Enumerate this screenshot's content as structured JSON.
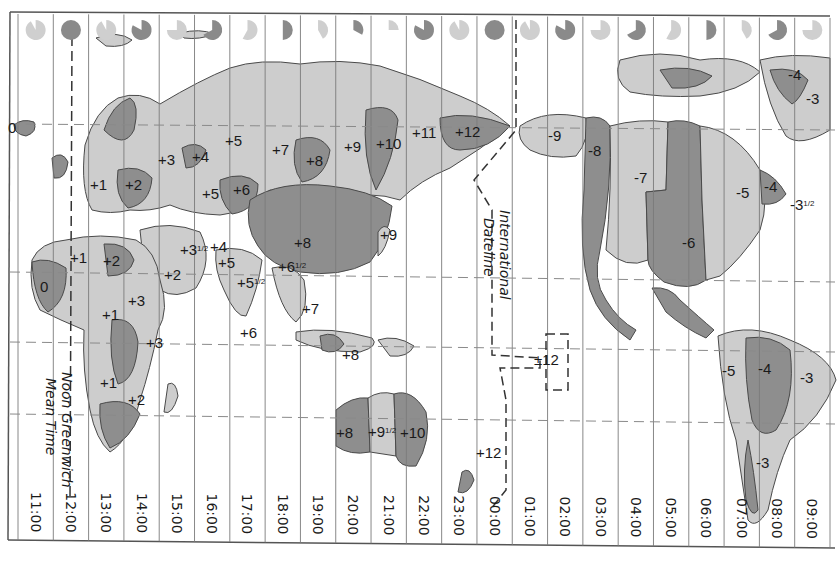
{
  "map": {
    "title": "World Time Zones",
    "colors": {
      "paper": "#ffffff",
      "land_light": "#cdcdcd",
      "land_dark": "#8e8e8e",
      "border": "#4a4a4a",
      "grid": "#7a7a7a",
      "text": "#1a1a1a",
      "clock_light": "#cfcfcf",
      "clock_dark": "#8a8a8a"
    },
    "columns": {
      "count": 23,
      "times": [
        "11:00",
        "12:00",
        "13:00",
        "14:00",
        "15:00",
        "16:00",
        "17:00",
        "18:00",
        "19:00",
        "20:00",
        "21:00",
        "22:00",
        "23:00",
        "00:00",
        "01:00",
        "02:00",
        "03:00",
        "04:00",
        "05:00",
        "06:00",
        "07:00",
        "08:00",
        "09:00"
      ]
    },
    "clock_faces": [
      {
        "tone": "light",
        "fill_fraction": 0.92
      },
      {
        "tone": "dark",
        "fill_fraction": 1.0
      },
      {
        "tone": "light",
        "fill_fraction": 0.92
      },
      {
        "tone": "dark",
        "fill_fraction": 0.83
      },
      {
        "tone": "light",
        "fill_fraction": 0.75
      },
      {
        "tone": "dark",
        "fill_fraction": 0.67
      },
      {
        "tone": "light",
        "fill_fraction": 0.58
      },
      {
        "tone": "dark",
        "fill_fraction": 0.5
      },
      {
        "tone": "light",
        "fill_fraction": 0.42
      },
      {
        "tone": "dark",
        "fill_fraction": 0.33
      },
      {
        "tone": "light",
        "fill_fraction": 0.25
      },
      {
        "tone": "dark",
        "fill_fraction": 0.83
      },
      {
        "tone": "light",
        "fill_fraction": 0.92
      },
      {
        "tone": "dark",
        "fill_fraction": 1.0
      },
      {
        "tone": "light",
        "fill_fraction": 0.92
      },
      {
        "tone": "dark",
        "fill_fraction": 0.83
      },
      {
        "tone": "light",
        "fill_fraction": 0.75
      },
      {
        "tone": "dark",
        "fill_fraction": 0.67
      },
      {
        "tone": "light",
        "fill_fraction": 0.58
      },
      {
        "tone": "dark",
        "fill_fraction": 0.5
      },
      {
        "tone": "light",
        "fill_fraction": 0.42
      },
      {
        "tone": "dark",
        "fill_fraction": 0.67
      },
      {
        "tone": "light",
        "fill_fraction": 0.75
      }
    ],
    "captions": {
      "greenwich_line1": "Noon Greenwich",
      "greenwich_line2": "Mean Time",
      "dateline_line1": "International",
      "dateline_line2": "Dateline"
    },
    "zone_labels": [
      {
        "text": "0",
        "x": 8,
        "y": 133
      },
      {
        "text": "+1",
        "x": 90,
        "y": 190
      },
      {
        "text": "+2",
        "x": 125,
        "y": 190
      },
      {
        "text": "+3",
        "x": 158,
        "y": 165
      },
      {
        "text": "+4",
        "x": 192,
        "y": 162
      },
      {
        "text": "+5",
        "x": 225,
        "y": 146
      },
      {
        "text": "+5",
        "x": 202,
        "y": 199
      },
      {
        "text": "+6",
        "x": 233,
        "y": 195
      },
      {
        "text": "+7",
        "x": 272,
        "y": 155
      },
      {
        "text": "+8",
        "x": 306,
        "y": 166
      },
      {
        "text": "+9",
        "x": 344,
        "y": 152
      },
      {
        "text": "+10",
        "x": 376,
        "y": 149
      },
      {
        "text": "+11",
        "x": 412,
        "y": 138
      },
      {
        "text": "+12",
        "x": 455,
        "y": 137
      },
      {
        "text": "+1",
        "x": 70,
        "y": 263
      },
      {
        "text": "+2",
        "x": 103,
        "y": 266
      },
      {
        "text": "0",
        "x": 40,
        "y": 292
      },
      {
        "text": "+3",
        "x": 128,
        "y": 306
      },
      {
        "text": "+3½",
        "x": 180,
        "y": 255
      },
      {
        "text": "+4",
        "x": 210,
        "y": 252
      },
      {
        "text": "+5",
        "x": 218,
        "y": 268
      },
      {
        "text": "+2",
        "x": 164,
        "y": 280
      },
      {
        "text": "+5½",
        "x": 237,
        "y": 288
      },
      {
        "text": "+6½",
        "x": 278,
        "y": 272
      },
      {
        "text": "+8",
        "x": 294,
        "y": 248
      },
      {
        "text": "+9",
        "x": 380,
        "y": 240
      },
      {
        "text": "+1",
        "x": 102,
        "y": 320
      },
      {
        "text": "+3",
        "x": 146,
        "y": 348
      },
      {
        "text": "+6",
        "x": 240,
        "y": 338
      },
      {
        "text": "+7",
        "x": 302,
        "y": 314
      },
      {
        "text": "+8",
        "x": 342,
        "y": 360
      },
      {
        "text": "+1",
        "x": 100,
        "y": 388
      },
      {
        "text": "+2",
        "x": 128,
        "y": 405
      },
      {
        "text": "+8",
        "x": 336,
        "y": 438
      },
      {
        "text": "+9½",
        "x": 368,
        "y": 437
      },
      {
        "text": "+10",
        "x": 400,
        "y": 438
      },
      {
        "text": "+12",
        "x": 476,
        "y": 458
      },
      {
        "text": "±12",
        "x": 534,
        "y": 365
      },
      {
        "text": "-9",
        "x": 548,
        "y": 141
      },
      {
        "text": "-8",
        "x": 588,
        "y": 156
      },
      {
        "text": "-7",
        "x": 634,
        "y": 183
      },
      {
        "text": "-6",
        "x": 682,
        "y": 248
      },
      {
        "text": "-5",
        "x": 736,
        "y": 198
      },
      {
        "text": "-4",
        "x": 764,
        "y": 192
      },
      {
        "text": "-3½",
        "x": 790,
        "y": 210
      },
      {
        "text": "-4",
        "x": 788,
        "y": 80
      },
      {
        "text": "-3",
        "x": 806,
        "y": 104
      },
      {
        "text": "-5",
        "x": 722,
        "y": 376
      },
      {
        "text": "-4",
        "x": 758,
        "y": 374
      },
      {
        "text": "-3",
        "x": 800,
        "y": 383
      },
      {
        "text": "-3",
        "x": 756,
        "y": 468
      }
    ]
  }
}
